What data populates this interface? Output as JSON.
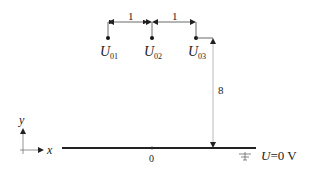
{
  "diagram": {
    "charges": [
      {
        "label": "U",
        "sub": "01"
      },
      {
        "label": "U",
        "sub": "02"
      },
      {
        "label": "U",
        "sub": "03"
      }
    ],
    "spacing_labels": [
      "1",
      "1"
    ],
    "height_label": "8",
    "axes": {
      "x": "x",
      "y": "y"
    },
    "origin_label": "0",
    "plane_label": {
      "var": "U",
      "rest": "=0 V"
    }
  }
}
